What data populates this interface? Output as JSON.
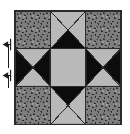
{
  "diagram": {
    "block_label": "quilt-block",
    "grid": {
      "rows": 3,
      "columns": 3
    },
    "colors": {
      "print_fabric": "#7e7e7e",
      "dark_fabric": "#0c0c0c",
      "light_fabric": "#b9b9b9",
      "outline": "#2b2b2b",
      "background": "#ffffff",
      "arrow": "#1a1a1a"
    },
    "cells": [
      {
        "position": "top-left",
        "type": "square",
        "fabric": "print"
      },
      {
        "position": "top-center",
        "type": "quarter-square-triangle",
        "triangles": {
          "top": "light",
          "right": "light",
          "bottom": "dark",
          "left": "light"
        }
      },
      {
        "position": "top-right",
        "type": "square",
        "fabric": "print"
      },
      {
        "position": "middle-left",
        "type": "quarter-square-triangle",
        "triangles": {
          "top": "light",
          "right": "dark",
          "bottom": "light",
          "left": "dark"
        }
      },
      {
        "position": "center",
        "type": "square",
        "fabric": "light"
      },
      {
        "position": "middle-right",
        "type": "quarter-square-triangle",
        "triangles": {
          "top": "light",
          "right": "dark",
          "bottom": "light",
          "left": "dark"
        }
      },
      {
        "position": "bottom-left",
        "type": "square",
        "fabric": "print"
      },
      {
        "position": "bottom-center",
        "type": "quarter-square-triangle",
        "triangles": {
          "top": "dark",
          "right": "light",
          "bottom": "light",
          "left": "light"
        }
      },
      {
        "position": "bottom-right",
        "type": "square",
        "fabric": "print"
      }
    ],
    "annotations": [
      {
        "name": "dimension-arrow-upper",
        "icon": "arrow-left-icon",
        "label": ""
      },
      {
        "name": "dimension-arrow-lower",
        "icon": "arrow-left-icon",
        "label": ""
      }
    ]
  }
}
